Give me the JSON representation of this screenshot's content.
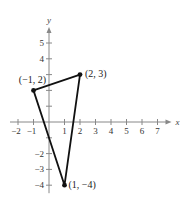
{
  "chart_data": {
    "type": "line",
    "title": "",
    "xlabel": "x",
    "ylabel": "y",
    "xlim": [
      -2,
      7
    ],
    "ylim": [
      -4,
      5
    ],
    "x_ticks": [
      -2,
      -1,
      1,
      2,
      3,
      4,
      5,
      6,
      7
    ],
    "x_tick_labels": [
      "−2",
      "−1",
      "1",
      "2",
      "3",
      "4",
      "5",
      "6",
      "7"
    ],
    "y_ticks": [
      -4,
      -3,
      -2,
      -1,
      1,
      2,
      3,
      4,
      5
    ],
    "y_tick_labels": [
      "−4",
      "−3",
      "−2",
      "",
      "",
      "",
      "",
      "4",
      "5"
    ],
    "grid": false,
    "series": [
      {
        "name": "triangle",
        "closed": true,
        "points": [
          {
            "x": -1,
            "y": 2,
            "label": "(−1, 2)"
          },
          {
            "x": 2,
            "y": 3,
            "label": "(2, 3)"
          },
          {
            "x": 1,
            "y": -4,
            "label": "(1, −4)"
          }
        ]
      }
    ],
    "colors": {
      "line": "#111111",
      "axis": "#888888"
    }
  }
}
